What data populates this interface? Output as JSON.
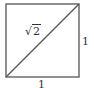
{
  "diagram": {
    "type": "unit-square-with-diagonal",
    "colors": {
      "stroke": "#555555",
      "text": "#333333",
      "background": "#ffffff"
    },
    "square": {
      "x": 6,
      "y": 4,
      "size": 73
    },
    "labels": {
      "diagonal": {
        "symbol": "√",
        "radicand": "2"
      },
      "right_side": "1",
      "bottom_side": "1"
    }
  }
}
